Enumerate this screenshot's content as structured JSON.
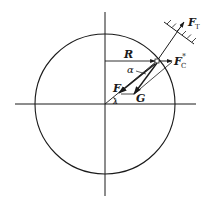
{
  "diagram": {
    "type": "force diagram",
    "labels": {
      "tension": "F",
      "tension_sub": "T",
      "centrifugal": "F",
      "centrifugal_sub": "C",
      "centrifugal_sup": "*",
      "radius": "R",
      "alpha": "α",
      "force_f": "F",
      "gravity": "G",
      "lambda": "λ"
    },
    "colors": {
      "stroke": "#1a1a1a",
      "background": "#ffffff"
    }
  }
}
